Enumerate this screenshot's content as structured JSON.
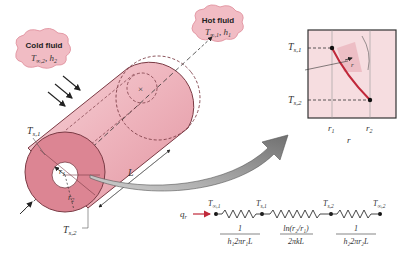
{
  "figure": {
    "cold_fluid": {
      "title": "Cold fluid",
      "params": "T∞,2, h2",
      "T": "T",
      "sub": "∞,2",
      "h": "h",
      "hsub": "2"
    },
    "hot_fluid": {
      "title": "Hot fluid",
      "params": "T∞,1, h1",
      "T": "T",
      "sub": "∞,1",
      "h": "h",
      "hsub": "1"
    },
    "cylinder": {
      "inner_surface_label": {
        "T": "T",
        "sub": "s,1"
      },
      "outer_surface_label": {
        "T": "T",
        "sub": "s,2"
      },
      "inner_radius": {
        "r": "r",
        "sub": "1"
      },
      "outer_radius": {
        "r": "r",
        "sub": "2"
      },
      "length": "L"
    },
    "profile_plot": {
      "y_ticks": [
        {
          "T": "T",
          "sub": "s,1"
        },
        {
          "T": "T",
          "sub": "s,2"
        }
      ],
      "x_ticks": [
        {
          "r": "r",
          "sub": "1"
        },
        {
          "r": "r",
          "sub": "2"
        }
      ],
      "xlabel": "r",
      "inner_label": "r"
    },
    "thermal_circuit": {
      "heat_rate": {
        "q": "q",
        "sub": "r"
      },
      "nodes": [
        {
          "T": "T",
          "sub": "∞,1"
        },
        {
          "T": "T",
          "sub": "s,1"
        },
        {
          "T": "T",
          "sub": "s,2"
        },
        {
          "T": "T",
          "sub": "∞,2"
        }
      ],
      "resistances": [
        {
          "num": "1",
          "den": "h₁2πr₁L"
        },
        {
          "num": "ln(r₂/r₁)",
          "den": "2πkL"
        },
        {
          "num": "1",
          "den": "h₂2πr₂L"
        }
      ]
    }
  },
  "colors": {
    "pink_light": "#f4c9cf",
    "pink_mid": "#e79aa5",
    "pink_dark": "#d27180",
    "plot_bg": "#f6dde0",
    "curve": "#c0283a",
    "arrow_gray": "#8a8a8a"
  }
}
